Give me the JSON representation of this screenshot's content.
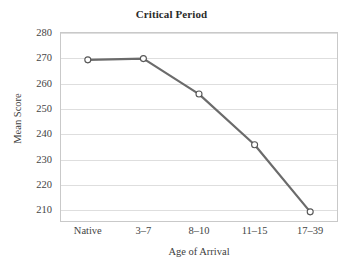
{
  "chart_data": {
    "type": "line",
    "title": "Critical Period",
    "xlabel": "Age of Arrival",
    "ylabel": "Mean Score",
    "categories": [
      "Native",
      "3–7",
      "8–10",
      "11–15",
      "17–39"
    ],
    "values": [
      269,
      269.5,
      255.5,
      235.5,
      209
    ],
    "ylim": [
      205,
      280
    ],
    "yticks": [
      210,
      220,
      230,
      240,
      250,
      260,
      270,
      280
    ],
    "ytick_labels": [
      "210",
      "220",
      "230",
      "240",
      "250",
      "260",
      "270",
      "280"
    ],
    "grid": "horizontal",
    "legend": "none",
    "series": [
      {
        "name": "Mean Score",
        "values": [
          269,
          269.5,
          255.5,
          235.5,
          209
        ],
        "line_color": "#6b6b6b",
        "marker": "open-circle",
        "marker_fill": "#ffffff",
        "marker_edge": "#555555"
      }
    ],
    "colors": {
      "line": "#6b6b6b",
      "grid": "#dedede",
      "frame": "#c9c9c9",
      "text": "#3d3d3d",
      "background": "#ffffff"
    }
  }
}
